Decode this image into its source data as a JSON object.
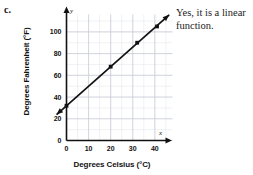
{
  "problem": {
    "letter": "c."
  },
  "answer": {
    "text": "Yes, it is a linear function."
  },
  "chart_data": {
    "type": "line",
    "title": "",
    "xlabel": "Degrees Celsius (°C)",
    "ylabel": "Degrees Fahrenheit (°F)",
    "x_axis_variable": "x",
    "y_axis_variable": "y",
    "xlim": [
      0,
      48
    ],
    "ylim": [
      0,
      116
    ],
    "xticks": [
      0,
      10,
      20,
      30,
      40
    ],
    "yticks": [
      0,
      20,
      40,
      60,
      80,
      100
    ],
    "xtick_labels": [
      "0",
      "10",
      "20",
      "30",
      "40"
    ],
    "ytick_labels": [
      "0",
      "20",
      "40",
      "60",
      "80",
      "100"
    ],
    "grid": true,
    "grid_minor_step_x": 5,
    "grid_minor_step_y": 10,
    "legend": "none",
    "line_color": "#111111",
    "grid_color": "#c9ccd6",
    "axis_color": "#111111",
    "arrow_both_ends": true,
    "series": [
      {
        "name": "Celsius to Fahrenheit",
        "x": [
          0,
          20,
          32,
          41
        ],
        "y": [
          32,
          68,
          90,
          105
        ],
        "marker": "square",
        "equation_note": "F = 1.8C + 32"
      }
    ],
    "line_extent": {
      "x_start": -4.5,
      "y_start": 23.9,
      "x_end": 46.5,
      "y_end": 115.7
    }
  }
}
